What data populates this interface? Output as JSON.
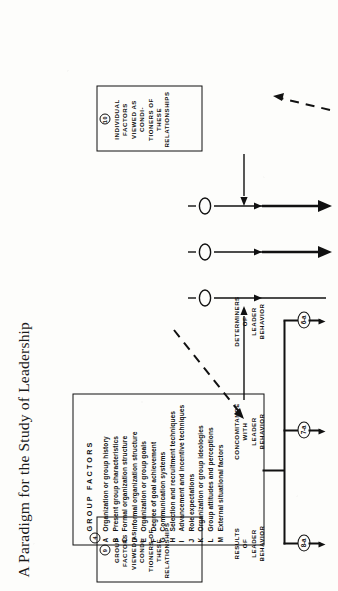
{
  "figure": {
    "title": "A Paradigm for the Study of Leadership",
    "orientation": "rotated-90-ccw"
  },
  "group_factors_panel": {
    "marker": "4",
    "heading": "GROUP   FACTORS",
    "items": [
      {
        "key": "A",
        "text": "Organization or group history"
      },
      {
        "key": "B",
        "text": "Present group characteristics"
      },
      {
        "key": "C",
        "text": "Formal organization structure"
      },
      {
        "key": "D",
        "text": "Informal organization structure"
      },
      {
        "key": "E",
        "text": "Organization or group goals"
      },
      {
        "key": "F",
        "text": "Degree of goal achievement"
      },
      {
        "key": "G",
        "text": "Communication systems"
      },
      {
        "key": "H",
        "text": "Selection and recruitment techniques"
      },
      {
        "key": "I",
        "text": "Advancement and incentive techniques"
      },
      {
        "key": "J",
        "text": "Role expectations"
      },
      {
        "key": "K",
        "text": "Organization or group ideologies"
      },
      {
        "key": "L",
        "text": "Group attitudes and perceptions"
      },
      {
        "key": "M",
        "text": "External situational factors"
      }
    ]
  },
  "nodes": [
    {
      "id": "node-8a",
      "label": "8-a"
    },
    {
      "id": "node-7a",
      "label": "7-a"
    },
    {
      "id": "node-6a",
      "label": "6-a"
    }
  ],
  "stage_labels": [
    {
      "id": "results",
      "lines": [
        "RESULTS",
        "OF",
        "LEADER",
        "BEHAVIOR"
      ]
    },
    {
      "id": "concomitance",
      "lines": [
        "CONCOMITANCE",
        "WITH",
        "LEADER",
        "BEHAVIOR"
      ]
    },
    {
      "id": "determiners",
      "lines": [
        "DETERMINERS",
        "OF",
        "LEADER",
        "BEHAVIOR"
      ]
    }
  ],
  "conditioner_boxes": [
    {
      "id": "group-conditioners",
      "marker": "9",
      "lines": [
        "GROUP  FACTORS",
        "VIEWED  AS  CONDI-",
        "TIONERS  OF  THESE",
        "RELATIONSHIPS"
      ]
    },
    {
      "id": "individual-conditioners",
      "marker": "10",
      "lines": [
        "INDIVIDUAL  FACTORS",
        "VIEWED  AS  CONDI-",
        "TIONERS  OF  THESE",
        "RELATIONSHIPS"
      ]
    }
  ],
  "colors": {
    "ink": "#111111",
    "paper": "#fdfdfb"
  }
}
